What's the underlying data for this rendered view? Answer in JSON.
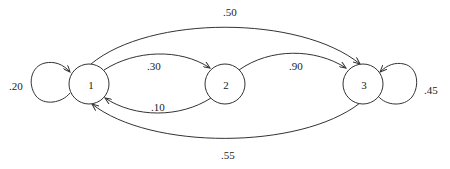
{
  "diagram": {
    "type": "markov-chain-state-diagram",
    "nodes": [
      {
        "id": "1",
        "label": "1"
      },
      {
        "id": "2",
        "label": "2"
      },
      {
        "id": "3",
        "label": "3"
      }
    ],
    "edges": [
      {
        "from": "1",
        "to": "1",
        "label": ".20"
      },
      {
        "from": "1",
        "to": "2",
        "label": ".30"
      },
      {
        "from": "2",
        "to": "1",
        "label": ".10"
      },
      {
        "from": "1",
        "to": "3",
        "label": ".50"
      },
      {
        "from": "2",
        "to": "3",
        "label": ".90"
      },
      {
        "from": "3",
        "to": "3",
        "label": ".45"
      },
      {
        "from": "3",
        "to": "1",
        "label": ".55"
      }
    ]
  },
  "colors": {
    "stroke": "#333333",
    "text": "#222222",
    "background": "#ffffff"
  }
}
